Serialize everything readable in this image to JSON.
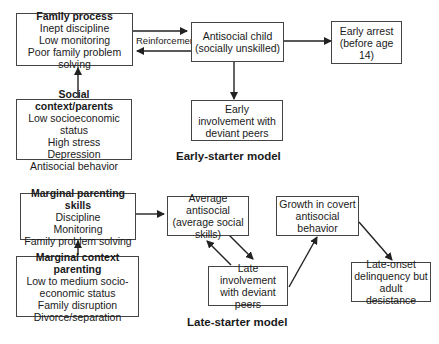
{
  "early_starter": {
    "caption": "Early-starter model",
    "family_process": {
      "title": "Family process",
      "lines": [
        "Inept discipline",
        "Low monitoring",
        "Poor family problem solving"
      ]
    },
    "social_context": {
      "title": "Social context/parents",
      "lines": [
        "Low socioeconomic status",
        "High stress",
        "Depression",
        "Antisocial behavior"
      ]
    },
    "antisocial_child": {
      "lines": [
        "Antisocial child",
        "(socially unskilled)"
      ]
    },
    "early_arrest": {
      "lines": [
        "Early arrest",
        "(before age 14)"
      ]
    },
    "early_involvement": {
      "lines": [
        "Early",
        "involvement with",
        "deviant peers"
      ]
    },
    "reinforcement_label": "Reinforcement"
  },
  "late_starter": {
    "caption": "Late-starter model",
    "marginal_parenting": {
      "title": "Marginal parenting skills",
      "lines": [
        "Discipline",
        "Monitoring",
        "Family problem solving"
      ]
    },
    "marginal_context": {
      "title": "Marginal context parenting",
      "lines": [
        "Low to medium socio-",
        "economic status",
        "Family disruption",
        "Divorce/separation"
      ]
    },
    "average_antisocial": {
      "lines": [
        "Average antisocial",
        "(average social",
        "skills)"
      ]
    },
    "late_involvement": {
      "lines": [
        "Late involvement",
        "with deviant peers"
      ]
    },
    "covert_growth": {
      "lines": [
        "Growth in covert",
        "antisocial behavior"
      ]
    },
    "late_onset": {
      "lines": [
        "Late-onset",
        "delinquency but",
        "adult desistance"
      ]
    }
  }
}
